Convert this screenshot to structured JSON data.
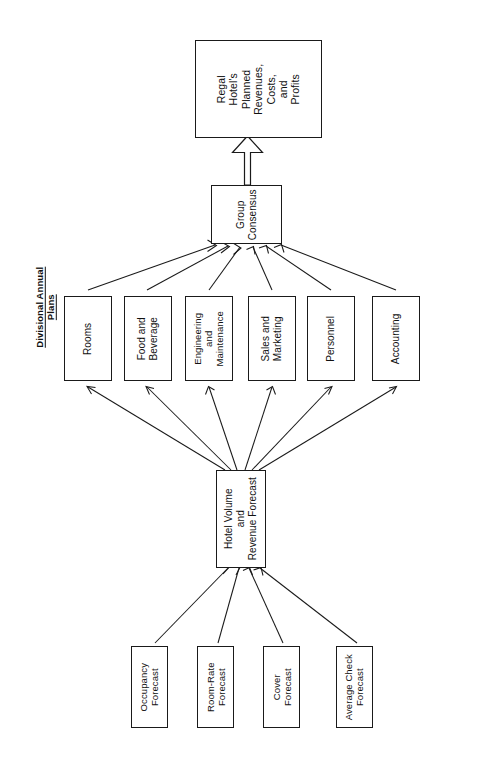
{
  "diagram": {
    "orientation": "rotated-90-ccw",
    "section_label": {
      "line1": "Divisional Annual",
      "line2": "Plans"
    },
    "top_outcome": {
      "name": "regal-hotels-planned-revenues-costs-and-profits",
      "lines": [
        "Regal",
        "Hotel's",
        "Planned",
        "Revenues,",
        "Costs,",
        "and",
        "Profits"
      ]
    },
    "consensus": {
      "name": "group-consensus",
      "lines": [
        "Group",
        "Consensus"
      ]
    },
    "divisions": [
      {
        "name": "rooms",
        "lines": [
          "Rooms"
        ]
      },
      {
        "name": "food-and-beverage",
        "lines": [
          "Food and",
          "Beverage"
        ]
      },
      {
        "name": "engineering-and-maintenance",
        "lines": [
          "Engineering",
          "and",
          "Maintenance"
        ]
      },
      {
        "name": "sales-and-marketing",
        "lines": [
          "Sales and",
          "Marketing"
        ]
      },
      {
        "name": "personnel",
        "lines": [
          "Personnel"
        ]
      },
      {
        "name": "accounting",
        "lines": [
          "Accounting"
        ]
      }
    ],
    "hub": {
      "name": "hotel-volume-and-revenue-forecast",
      "lines": [
        "Hotel Volume",
        "and",
        "Revenue Forecast"
      ]
    },
    "forecasts": [
      {
        "name": "occupancy-forecast",
        "lines": [
          "Occupancy",
          "Forecast"
        ]
      },
      {
        "name": "room-rate-forecast",
        "lines": [
          "Room-Rate",
          "Forecast"
        ]
      },
      {
        "name": "cover-forecast",
        "lines": [
          "Cover",
          "Forecast"
        ]
      },
      {
        "name": "average-check-forecast",
        "lines": [
          "Average Check",
          "Forecast"
        ]
      }
    ],
    "colors": {
      "stroke": "#1a1a1a",
      "fill": "#ffffff",
      "text": "#111111",
      "background": "#ffffff"
    }
  }
}
